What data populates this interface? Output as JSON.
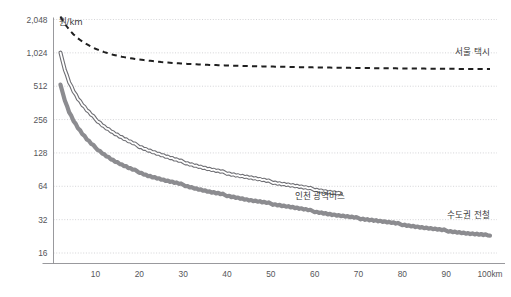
{
  "chart_data": {
    "type": "line",
    "title": "",
    "subtitle": "",
    "xlabel": "",
    "ylabel": "원/km",
    "unit_label": "원/km",
    "x_axis": {
      "min": 0,
      "max": 103,
      "scale": "linear",
      "ticks": [
        10,
        20,
        30,
        40,
        50,
        60,
        70,
        80,
        90,
        100
      ],
      "tick_labels": [
        "10",
        "20",
        "30",
        "40",
        "50",
        "60",
        "70",
        "80",
        "90",
        "100km"
      ],
      "unit": "km"
    },
    "y_axis": {
      "scale": "log2",
      "min": 14,
      "max": 2300,
      "ticks": [
        16,
        32,
        64,
        128,
        256,
        512,
        1024,
        2048
      ],
      "tick_labels": [
        "16",
        "32",
        "64",
        "128",
        "256",
        "512",
        "1,024",
        "2,048"
      ],
      "grid": true,
      "unit": "원/km"
    },
    "legend_position": "inline-right",
    "series": [
      {
        "name": "서울 택시",
        "label": "서울 택시",
        "style": "dashed",
        "color": "#1f1f1f",
        "width": 2.0,
        "label_x": 100,
        "label_y": 980,
        "x": [
          2,
          3,
          4,
          5,
          6,
          7,
          8,
          9,
          10,
          12,
          14,
          16,
          18,
          20,
          25,
          30,
          35,
          40,
          45,
          50,
          55,
          60,
          65,
          70,
          75,
          80,
          85,
          90,
          95,
          100
        ],
        "y": [
          2180,
          1870,
          1660,
          1500,
          1385,
          1295,
          1225,
          1165,
          1115,
          1040,
          985,
          945,
          915,
          890,
          845,
          818,
          800,
          788,
          778,
          770,
          763,
          757,
          752,
          748,
          744,
          741,
          738,
          735,
          733,
          731
        ]
      },
      {
        "name": "인천 광역버스",
        "label": "인천 광역버스",
        "style": "outline-double",
        "color": "#6f6f74",
        "width": 2.4,
        "label_x": 67,
        "label_y": 49,
        "x": [
          2,
          3,
          4,
          5,
          6,
          7,
          8,
          9,
          10,
          12,
          14,
          16,
          18,
          20,
          22,
          24,
          26,
          28,
          30,
          33,
          36,
          39,
          42,
          45,
          48,
          51,
          54,
          57,
          60,
          63,
          66
        ],
        "y": [
          1030,
          720,
          560,
          462,
          395,
          348,
          312,
          283,
          259,
          222,
          196,
          176,
          160,
          147,
          136,
          127,
          119,
          112,
          106,
          98,
          91,
          86,
          81,
          77,
          73,
          69,
          66,
          63,
          60,
          57,
          55
        ]
      },
      {
        "name": "수도권 전철",
        "label": "수도권 전철",
        "style": "solid-thick",
        "color": "#8c8c90",
        "width": 4.2,
        "label_x": 100,
        "label_y": 33,
        "x": [
          2,
          3,
          4,
          5,
          6,
          7,
          8,
          9,
          10,
          12,
          14,
          16,
          18,
          20,
          22,
          24,
          26,
          28,
          30,
          33,
          36,
          39,
          42,
          45,
          48,
          51,
          54,
          57,
          60,
          65,
          70,
          75,
          80,
          85,
          90,
          95,
          100
        ],
        "y": [
          530,
          380,
          300,
          250,
          215,
          190,
          170,
          155,
          143,
          124,
          110,
          100,
          92,
          86,
          80,
          76,
          72,
          69,
          66,
          61,
          57,
          54,
          51,
          48,
          46,
          44,
          42,
          40,
          38,
          35,
          33,
          31,
          29,
          27,
          25.5,
          24,
          23
        ]
      }
    ],
    "annotations": []
  },
  "meta": {
    "background": "#ffffff",
    "grid_color": "#c9c9cd",
    "axis_color": "#8d8d92",
    "text_color": "#3a3a3a"
  }
}
